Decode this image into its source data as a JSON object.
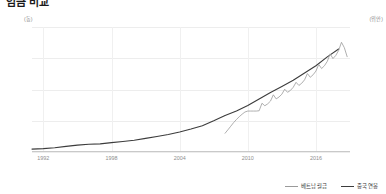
{
  "title": "임금 비교",
  "axes": {
    "left_unit": "(동)",
    "right_unit": "(위안)",
    "left_ticks": [
      "8000",
      "6000",
      "4000",
      "2000",
      "0"
    ],
    "right_ticks": [
      "100000",
      "80000",
      "60000",
      "40000",
      "20000",
      "0"
    ],
    "x_ticks": [
      "1992",
      "1998",
      "2004",
      "2010",
      "2016"
    ]
  },
  "legend": [
    {
      "label": "베트남 월급",
      "color": "#9a9a9a"
    },
    {
      "label": "중국 연봉",
      "color": "#3c3c3c"
    }
  ],
  "chart_data": {
    "type": "line",
    "title": "임금 비교",
    "xlabel": "",
    "ylabel": "동",
    "y2label": "위안",
    "xlim": [
      1991,
      2019
    ],
    "ylim": [
      0,
      8000
    ],
    "y2lim": [
      0,
      100000
    ],
    "grid": true,
    "legend_position": "bottom-right",
    "xticks": [
      1992,
      1998,
      2004,
      2010,
      2016
    ],
    "yticks": [
      0,
      2000,
      4000,
      6000,
      8000
    ],
    "y2ticks": [
      0,
      20000,
      40000,
      60000,
      80000,
      100000
    ],
    "series": [
      {
        "name": "중국 연봉",
        "axis": "right",
        "color": "#3c3c3c",
        "x": [
          1991,
          1992,
          1993,
          1994,
          1995,
          1996,
          1997,
          1998,
          1999,
          2000,
          2001,
          2002,
          2003,
          2004,
          2005,
          2006,
          2007,
          2008,
          2009,
          2010,
          2011,
          2012,
          2013,
          2014,
          2015,
          2016,
          2017,
          2018
        ],
        "values": [
          2340,
          2711,
          3371,
          4538,
          5500,
          6210,
          6470,
          7479,
          8346,
          9371,
          10870,
          12422,
          14040,
          16024,
          18364,
          21001,
          24932,
          29229,
          32736,
          37147,
          42452,
          47593,
          52388,
          57361,
          63241,
          68993,
          76121,
          82413
        ]
      },
      {
        "name": "베트남 월급",
        "axis": "left",
        "color": "#9a9a9a",
        "x": [
          2008.0,
          2008.25,
          2008.5,
          2008.75,
          2009.0,
          2009.25,
          2009.5,
          2009.75,
          2010.0,
          2010.25,
          2010.5,
          2010.75,
          2011.0,
          2011.25,
          2011.5,
          2011.75,
          2012.0,
          2012.25,
          2012.5,
          2012.75,
          2013.0,
          2013.25,
          2013.5,
          2013.75,
          2014.0,
          2014.25,
          2014.5,
          2014.75,
          2015.0,
          2015.25,
          2015.5,
          2015.75,
          2016.0,
          2016.25,
          2016.5,
          2016.75,
          2017.0,
          2017.25,
          2017.5,
          2017.75,
          2018.0,
          2018.25,
          2018.5,
          2018.75
        ],
        "values": [
          1200,
          1420,
          1650,
          1880,
          2080,
          2260,
          2420,
          2560,
          2620,
          2620,
          2620,
          2620,
          2640,
          3120,
          2960,
          3080,
          3260,
          3660,
          3400,
          3520,
          3700,
          4020,
          3820,
          3940,
          4140,
          4460,
          4260,
          4400,
          4620,
          5020,
          4780,
          4940,
          5180,
          5600,
          5340,
          5520,
          5800,
          6280,
          5980,
          6180,
          6500,
          7020,
          6680,
          6100
        ]
      }
    ]
  }
}
